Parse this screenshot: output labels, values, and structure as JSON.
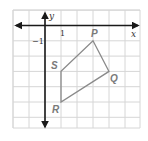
{
  "figure": {
    "type": "coordinate-grid-polygon",
    "grid": {
      "x_min": -2,
      "x_max": 6,
      "y_min": -6,
      "y_max": 1,
      "cell_width_px": 16,
      "cell_height_px": 15.3,
      "origin_px": [
        45,
        25.5
      ],
      "line_color": "#d6d6d6"
    },
    "axes": {
      "x_label": "x",
      "y_label": "y",
      "color": "#1a1a1a"
    },
    "tick_labels": {
      "x_one": "1",
      "y_neg_one": "−1"
    },
    "polygon": {
      "color": "#8a8a8a",
      "vertices": [
        {
          "label": "P",
          "x": 3,
          "y": -1
        },
        {
          "label": "Q",
          "x": 4,
          "y": -3
        },
        {
          "label": "R",
          "x": 1,
          "y": -5
        },
        {
          "label": "S",
          "x": 1,
          "y": -3
        }
      ]
    }
  }
}
